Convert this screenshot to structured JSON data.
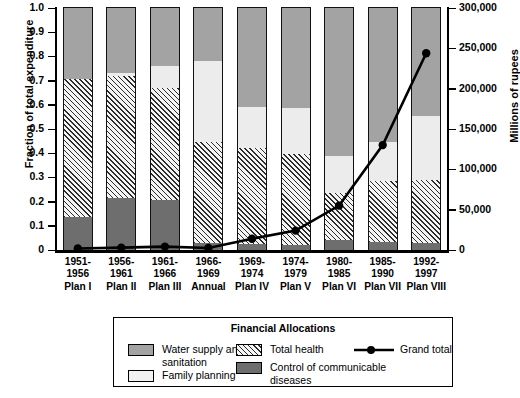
{
  "chart_data": {
    "type": "bar",
    "subtype": "stacked-bar-with-line-overlay",
    "title": "",
    "xlabel": "",
    "ylabel": "Fraction of total expenditure",
    "ylabel_right": "Millions of rupees",
    "ylim": [
      0,
      1.0
    ],
    "ylim_right": [
      0,
      300000
    ],
    "grid": false,
    "legend_position": "bottom",
    "legend_title": "Financial Allocations",
    "categories": [
      "1951-1956 Plan I",
      "1956-1961 Plan II",
      "1961-1966 Plan III",
      "1966-1969 Annual",
      "1969-1974 Plan IV",
      "1974-1979 Plan V",
      "1980-1985 Plan VI",
      "1985-1990 Plan VII",
      "1992-1997 Plan VIII"
    ],
    "category_years": [
      "1951-\n1956",
      "1956-\n1961",
      "1961-\n1966",
      "1966-\n1969",
      "1969-\n1974",
      "1974-\n1979",
      "1980-\n1985",
      "1985-\n1990",
      "1992-\n1997"
    ],
    "category_plans": [
      "Plan I",
      "Plan II",
      "Plan III",
      "Annual",
      "Plan IV",
      "Plan V",
      "Plan VI",
      "Plan VII",
      "Plan VIII"
    ],
    "ytick_labels": [
      "0",
      "0.1",
      "0.2",
      "0.3",
      "0.4",
      "0.5",
      "0.6",
      "0.7",
      "0.8",
      "0.9",
      "1.0"
    ],
    "ytick_values": [
      0,
      0.1,
      0.2,
      0.3,
      0.4,
      0.5,
      0.6,
      0.7,
      0.8,
      0.9,
      1.0
    ],
    "ytick_labels_right": [
      "0",
      "50,000",
      "100,000",
      "150,000",
      "200,000",
      "250,000",
      "300,000"
    ],
    "ytick_values_right": [
      0,
      50000,
      100000,
      150000,
      200000,
      250000,
      300000
    ],
    "series": [
      {
        "name": "Control of communicable diseases",
        "color": "#6e6e6e",
        "pattern": "solid-dark-gray",
        "values": [
          0.135,
          0.215,
          0.205,
          0.03,
          0.025,
          0.02,
          0.04,
          0.035,
          0.03
        ]
      },
      {
        "name": "Total health",
        "color": "#f4f4f4",
        "pattern": "diagonal-hatch",
        "values": [
          0.57,
          0.505,
          0.465,
          0.415,
          0.395,
          0.375,
          0.195,
          0.25,
          0.26
        ]
      },
      {
        "name": "Family planning",
        "color": "#ececec",
        "pattern": "solid-light",
        "values": [
          0.0,
          0.01,
          0.09,
          0.335,
          0.17,
          0.19,
          0.155,
          0.16,
          0.265
        ]
      },
      {
        "name": "Water supply and sanitation",
        "color": "#a3a3a3",
        "pattern": "solid-mid-gray",
        "values": [
          0.295,
          0.27,
          0.24,
          0.22,
          0.41,
          0.415,
          0.61,
          0.555,
          0.445
        ]
      }
    ],
    "line_series": {
      "name": "Grand total",
      "color": "#000000",
      "marker": "filled-circle",
      "axis": "right",
      "units": "Millions of rupees",
      "values": [
        1800,
        3000,
        4200,
        2500,
        14000,
        24000,
        55000,
        130000,
        244000
      ]
    }
  },
  "legend": {
    "title": "Financial Allocations",
    "items": [
      {
        "label": "Water supply and sanitation",
        "swatch": "water-supply-swatch"
      },
      {
        "label": "Family planning",
        "swatch": "family-planning-swatch"
      },
      {
        "label": "Total health",
        "swatch": "total-health-swatch"
      },
      {
        "label": "Control of communicable diseases",
        "swatch": "communicable-diseases-swatch"
      },
      {
        "label": "Grand total",
        "swatch": "grand-total-line-marker"
      }
    ],
    "water_label_line1": "Water supply and",
    "water_label_line2": "sanitation",
    "family_label": "Family planning",
    "health_label": "Total health",
    "comm_label_line1": "Control of communicable",
    "comm_label_line2": "diseases",
    "grand_label": "Grand total"
  },
  "axes": {
    "left_title": "Fraction of total expenditure",
    "right_title": "Millions of rupees"
  },
  "colors": {
    "water": "#a3a3a3",
    "family": "#ececec",
    "health_bg": "#f4f4f4",
    "health_hatch": "#2b2b2b",
    "communicable": "#6e6e6e",
    "line": "#000000",
    "frame": "#000000"
  }
}
